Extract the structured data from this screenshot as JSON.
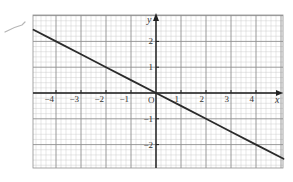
{
  "chart_data": {
    "type": "line",
    "title": "",
    "xlabel": "x",
    "ylabel": "y",
    "origin_label": "O",
    "xlim": [
      -4.9,
      5.1
    ],
    "ylim": [
      -2.9,
      3.0
    ],
    "grid": true,
    "grid_minor_step": 0.2,
    "grid_major_step": 1,
    "x_ticks": [
      -4,
      -3,
      -2,
      -1,
      1,
      2,
      3,
      4
    ],
    "x_tick_labels": [
      "−4",
      "−3",
      "−2",
      "−1",
      "1",
      "2",
      "3",
      "4"
    ],
    "y_ticks": [
      2,
      1,
      -1,
      -2
    ],
    "y_tick_labels": [
      "2",
      "1",
      "−1",
      "−2"
    ],
    "series": [
      {
        "name": "y = -x/2",
        "x": [
          -4.9,
          -4,
          -3,
          -2,
          -1,
          0,
          1,
          2,
          3,
          4,
          5.1
        ],
        "y": [
          2.45,
          2,
          1.5,
          1,
          0.5,
          0,
          -0.5,
          -1,
          -1.5,
          -2,
          -2.55
        ],
        "color": "#2a2a2a"
      }
    ],
    "legend": null
  },
  "colors": {
    "minor_grid": "#c9c9c9",
    "major_grid": "#8f8f8f",
    "axis": "#222222",
    "line": "#2a2a2a",
    "pen_mark": "#b5b5b5"
  }
}
